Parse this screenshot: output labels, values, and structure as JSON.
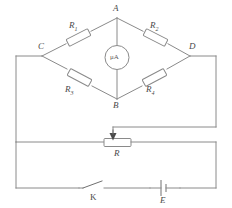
{
  "diagram": {
    "background_color": "#ffffff",
    "line_color": "#8a8a8a",
    "label_color": "#4a4a4a"
  },
  "nodes": [
    {
      "id": "A",
      "label": "A",
      "position": "top"
    },
    {
      "id": "B",
      "label": "B",
      "position": "bottom"
    },
    {
      "id": "C",
      "label": "C",
      "position": "left"
    },
    {
      "id": "D",
      "label": "D",
      "position": "right"
    }
  ],
  "resistors": [
    {
      "id": "R1",
      "label": "R",
      "subscript": "1",
      "branch": "C-A",
      "arm": "upper-left"
    },
    {
      "id": "R2",
      "label": "R",
      "subscript": "2",
      "branch": "A-D",
      "arm": "upper-right"
    },
    {
      "id": "R3",
      "label": "R",
      "subscript": "3",
      "branch": "C-B",
      "arm": "lower-left"
    },
    {
      "id": "R4",
      "label": "R",
      "subscript": "4",
      "branch": "B-D",
      "arm": "lower-right"
    }
  ],
  "meter": {
    "id": "microammeter",
    "label": "μA",
    "branch": "A-B",
    "type": "galvanometer"
  },
  "rheostat": {
    "id": "R",
    "label": "R",
    "type": "variable-resistor-with-wiper"
  },
  "battery": {
    "id": "E",
    "label": "E",
    "type": "cell"
  },
  "switch": {
    "id": "K",
    "label": "K",
    "state": "open"
  }
}
